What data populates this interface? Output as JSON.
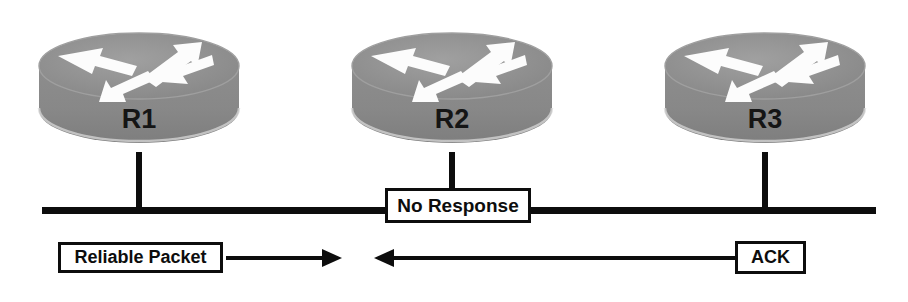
{
  "diagram": {
    "type": "network-topology",
    "colors": {
      "router_body": "#8a8a8a",
      "router_top": "#9a9a9a",
      "router_arrow": "#ffffff",
      "line": "#0d0d0d",
      "label_box_fill": "#ffffff",
      "label_text": "#0d0d0d",
      "background": "#ffffff"
    },
    "routers": [
      {
        "id": "r1",
        "label": "R1",
        "icon": "router-icon",
        "x": 36,
        "y": 22
      },
      {
        "id": "r2",
        "label": "R2",
        "icon": "router-icon",
        "x": 349,
        "y": 22
      },
      {
        "id": "r3",
        "label": "R3",
        "icon": "router-icon",
        "x": 662,
        "y": 22
      }
    ],
    "bus": {
      "name": "shared-ethernet-bus",
      "x": 42,
      "y": 207,
      "width": 834
    },
    "connectors": [
      {
        "name": "connector-r1",
        "x": 136,
        "y": 152,
        "height": 58
      },
      {
        "name": "connector-r2",
        "x": 449,
        "y": 152,
        "height": 40
      },
      {
        "name": "connector-r3",
        "x": 762,
        "y": 152,
        "height": 58
      }
    ],
    "labels": {
      "no_response": "No Response",
      "reliable_packet": "Reliable Packet",
      "ack": "ACK"
    },
    "arrows": [
      {
        "name": "reliable-packet-arrow",
        "direction": "right",
        "from_label": "Reliable Packet",
        "x": 226,
        "y": 247,
        "width": 116,
        "height": 22
      },
      {
        "name": "ack-arrow",
        "direction": "left",
        "from_label": "ACK",
        "x": 372,
        "y": 247,
        "width": 362,
        "height": 22
      }
    ]
  }
}
